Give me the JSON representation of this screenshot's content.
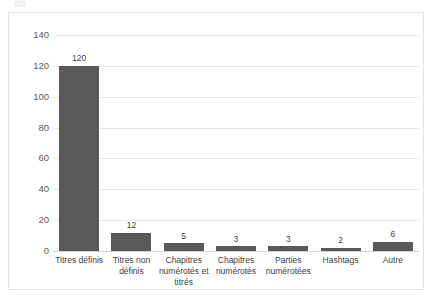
{
  "chart_data": {
    "type": "bar",
    "title": "",
    "xlabel": "",
    "ylabel": "",
    "categories": [
      "Titres définis",
      "Titres non définis",
      "Chapitres numérotés et titrés",
      "Chapitres numérotés",
      "Parties numérotées",
      "Hashtags",
      "Autre"
    ],
    "values": [
      120,
      12,
      5,
      3,
      3,
      2,
      6
    ],
    "data_labels": [
      "120",
      "12",
      "5",
      "3",
      "3",
      "2",
      "6"
    ],
    "ylim": [
      0,
      140
    ],
    "y_ticks": [
      0,
      20,
      40,
      60,
      80,
      100,
      120,
      140
    ],
    "y_tick_labels": [
      "0",
      "20",
      "40",
      "60",
      "80",
      "100",
      "120",
      "140"
    ],
    "grid": true,
    "legend": false,
    "legend_position": "none",
    "bar_color": "#595959",
    "gridline_color": "#e8e8e8",
    "frame_color": "#e2e2e2",
    "background_color": "#ffffff",
    "text_color": "#404040"
  }
}
